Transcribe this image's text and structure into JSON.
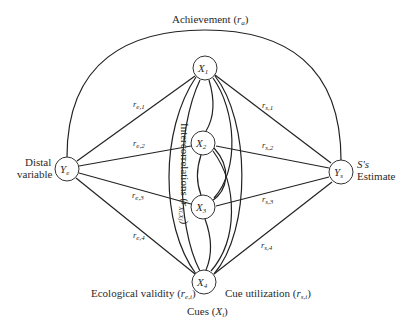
{
  "achievement": {
    "label": "Achievement (",
    "symbol": "r",
    "sub": "a",
    "close": ")"
  },
  "distal": {
    "line1": "Distal",
    "line2": "variable",
    "node": "Y",
    "node_sub": "e"
  },
  "estimate": {
    "line1": "S's",
    "line2": "Estimate",
    "node": "Y",
    "node_sub": "s"
  },
  "cues": [
    {
      "id": "X1",
      "symbol": "X",
      "sub": "1"
    },
    {
      "id": "X2",
      "symbol": "X",
      "sub": "2"
    },
    {
      "id": "X3",
      "symbol": "X",
      "sub": "3"
    },
    {
      "id": "X4",
      "symbol": "X",
      "sub": "4"
    }
  ],
  "ecological_edges": [
    {
      "symbol": "r",
      "sub": "e,1"
    },
    {
      "symbol": "r",
      "sub": "e,2"
    },
    {
      "symbol": "r",
      "sub": "e,3"
    },
    {
      "symbol": "r",
      "sub": "e,4"
    }
  ],
  "utilization_edges": [
    {
      "symbol": "r",
      "sub": "s,1"
    },
    {
      "symbol": "r",
      "sub": "s,2"
    },
    {
      "symbol": "r",
      "sub": "s,3"
    },
    {
      "symbol": "r",
      "sub": "s,4"
    }
  ],
  "intercorrelations": {
    "label": "Intercorrelations (",
    "symbol": "r",
    "sub": "Xi,Xj",
    "close": ")"
  },
  "ecological_validity": {
    "label": "Ecological validity (",
    "symbol": "r",
    "sub": "e,i",
    "close": ")"
  },
  "cue_utilization": {
    "label": "Cue utilization (",
    "symbol": "r",
    "sub": "s,i",
    "close": ")"
  },
  "cues_label": {
    "label": "Cues (",
    "symbol": "X",
    "sub": "i",
    "close": ")"
  }
}
